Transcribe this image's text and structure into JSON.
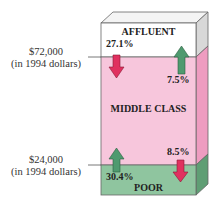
{
  "diagram": {
    "sections": {
      "affluent": {
        "label": "AFFLUENT",
        "color": "#ffffff"
      },
      "middle": {
        "label": "MIDDLE CLASS",
        "color": "#f7c6dc"
      },
      "poor": {
        "label": "POOR",
        "color": "#8fc59f"
      }
    },
    "thresholds": {
      "upper": {
        "amount": "$72,000",
        "note": "(in 1994 dollars)"
      },
      "lower": {
        "amount": "$24,000",
        "note": "(in 1994 dollars)"
      }
    },
    "flows": {
      "affluent_to_middle": {
        "value": "27.1%",
        "direction": "down",
        "color": "#e0305f"
      },
      "middle_to_affluent": {
        "value": "7.5%",
        "direction": "up",
        "color": "#4f9a6f"
      },
      "poor_to_middle": {
        "value": "30.4%",
        "direction": "up",
        "color": "#4f9a6f"
      },
      "middle_to_poor": {
        "value": "8.5%",
        "direction": "down",
        "color": "#e0305f"
      }
    }
  }
}
